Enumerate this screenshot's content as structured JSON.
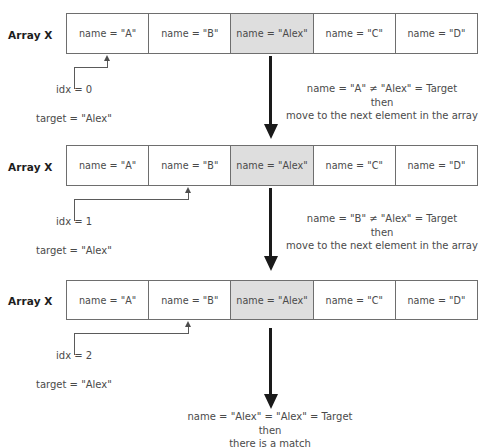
{
  "diagram": {
    "array_label": "Array X",
    "target_label": "target = \"Alex\"",
    "highlight_color": "#dedede",
    "arrow_color": "#1a1a1a",
    "cells": [
      "name = \"A\"",
      "name = \"B\"",
      "name = \"Alex\"",
      "name = \"C\"",
      "name = \"D\""
    ],
    "highlight_index": 2,
    "steps": [
      {
        "idx_label": "idx = 0",
        "pointer_cell": 0,
        "note_line1": "name = \"A\" ≠ \"Alex\" = Target",
        "note_line2": "then",
        "note_line3": "move to the next element in the array"
      },
      {
        "idx_label": "idx = 1",
        "pointer_cell": 1,
        "note_line1": "name = \"B\" ≠ \"Alex\" = Target",
        "note_line2": "then",
        "note_line3": "move to the next element in the array"
      },
      {
        "idx_label": "idx = 2",
        "pointer_cell": 1,
        "note_line1": "name = \"Alex\" = \"Alex\" = Target",
        "note_line2": "then",
        "note_line3": "there is a match"
      }
    ]
  }
}
